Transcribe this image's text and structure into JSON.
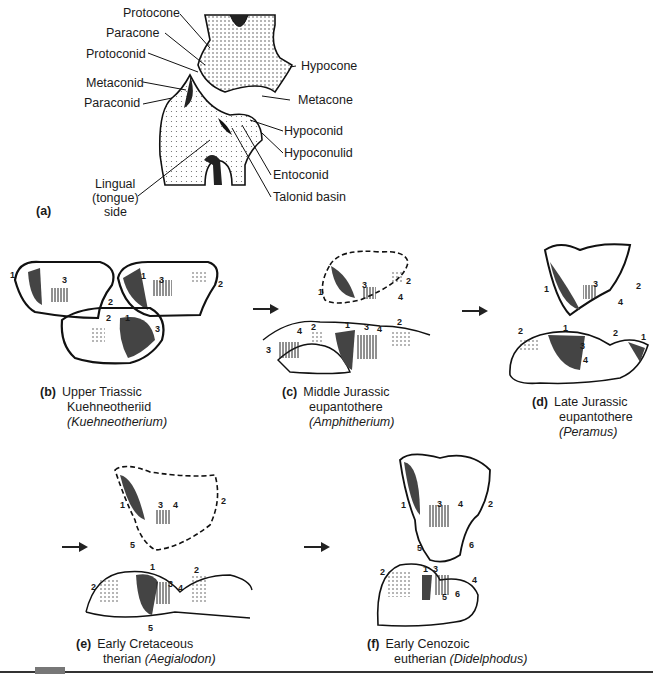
{
  "panel_a": {
    "tag": "(a)",
    "labels": {
      "protocone": "Protocone",
      "paracone": "Paracone",
      "protoconid": "Protoconid",
      "metaconid": "Metaconid",
      "paraconid": "Paraconid",
      "hypocone": "Hypocone",
      "metacone": "Metacone",
      "hypoconid": "Hypoconid",
      "hypoconulid": "Hypoconulid",
      "entoconid": "Entoconid",
      "talonid_basin": "Talonid basin",
      "lingual_1": "Lingual",
      "lingual_2": "(tongue)",
      "lingual_3": "side"
    }
  },
  "panels": [
    {
      "tag": "(b)",
      "line1": "Upper Triassic",
      "line2": "Kuehneotheriid",
      "genus": "(Kuehneotherium)"
    },
    {
      "tag": "(c)",
      "line1": "Middle Jurassic",
      "line2": "eupantothere",
      "genus": "(Amphitherium)"
    },
    {
      "tag": "(d)",
      "line1": "Late Jurassic",
      "line2": "eupantothere",
      "genus": "(Peramus)"
    },
    {
      "tag": "(e)",
      "line1": "Early Cretaceous",
      "line2": "therian",
      "genus": "(Aegialodon)"
    },
    {
      "tag": "(f)",
      "line1": "Early Cenozoic",
      "line2": "eutherian",
      "genus": "(Didelphodus)"
    }
  ],
  "cusp_numbers": [
    "1",
    "2",
    "3",
    "4",
    "5",
    "6"
  ],
  "colors": {
    "ink": "#1a1a1a",
    "dark_fill": "#444444",
    "stipple": "#9a9a9a",
    "rule": "#333333"
  }
}
